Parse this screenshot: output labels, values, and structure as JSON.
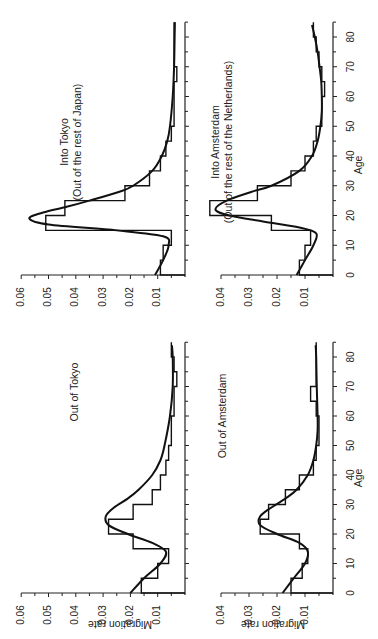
{
  "figure": {
    "orientation": "rotated 90 degrees counter-clockwise",
    "shared_xlabel": "Age",
    "shared_ylabel": "Migration rate"
  },
  "chart_data": [
    {
      "type": "line",
      "title": "Into Tokyo",
      "subtitle": "(Out of the rest of Japan)",
      "xlabel": "Age",
      "ylabel": "Migration rate",
      "xlim": [
        0,
        85
      ],
      "ylim": [
        0,
        0.06
      ],
      "x_ticks": [
        0,
        10,
        20,
        30,
        40,
        50,
        60,
        70,
        80
      ],
      "y_ticks": [
        0.01,
        0.02,
        0.03,
        0.04,
        0.05,
        0.06
      ],
      "series": [
        {
          "name": "observed (5-year age groups)",
          "style": "step",
          "x": [
            0,
            5,
            10,
            15,
            20,
            25,
            30,
            35,
            40,
            45,
            50,
            55,
            60,
            65,
            70,
            75,
            80
          ],
          "values": [
            0.009,
            0.008,
            0.005,
            0.051,
            0.044,
            0.022,
            0.013,
            0.009,
            0.007,
            0.005,
            0.004,
            0.004,
            0.004,
            0.003,
            0.004,
            0.004,
            0.004
          ]
        },
        {
          "name": "model schedule",
          "style": "smooth",
          "x": [
            0,
            5,
            10,
            13,
            15,
            17,
            19,
            21,
            23,
            25,
            28,
            30,
            35,
            40,
            45,
            50,
            60,
            70,
            80,
            85
          ],
          "values": [
            0.011,
            0.008,
            0.006,
            0.008,
            0.025,
            0.05,
            0.057,
            0.052,
            0.043,
            0.035,
            0.024,
            0.019,
            0.012,
            0.0085,
            0.0065,
            0.0055,
            0.0045,
            0.004,
            0.0038,
            0.0037
          ]
        }
      ]
    },
    {
      "type": "line",
      "title": "Into Amsterdam",
      "subtitle": "(Out of the rest of the Netherlands)",
      "xlabel": "Age",
      "ylabel": "Migration rate",
      "xlim": [
        0,
        85
      ],
      "ylim": [
        0,
        0.04
      ],
      "x_ticks": [
        0,
        10,
        20,
        30,
        40,
        50,
        60,
        70,
        80
      ],
      "y_ticks": [
        0.01,
        0.02,
        0.03,
        0.04
      ],
      "series": [
        {
          "name": "observed (5-year age groups)",
          "style": "step",
          "x": [
            0,
            5,
            10,
            15,
            20,
            25,
            30,
            35,
            40,
            45,
            50,
            55,
            60,
            65,
            70,
            75,
            80
          ],
          "values": [
            0.012,
            0.01,
            0.008,
            0.022,
            0.044,
            0.027,
            0.015,
            0.01,
            0.007,
            0.006,
            0.004,
            0.004,
            0.003,
            0.004,
            0.005,
            0.006,
            0.007
          ]
        },
        {
          "name": "model schedule",
          "style": "smooth",
          "x": [
            0,
            5,
            10,
            14,
            16,
            18,
            20,
            22,
            25,
            28,
            30,
            35,
            40,
            45,
            50,
            55,
            60,
            65,
            70,
            75,
            80,
            84
          ],
          "values": [
            0.013,
            0.01,
            0.007,
            0.006,
            0.012,
            0.025,
            0.037,
            0.042,
            0.038,
            0.029,
            0.022,
            0.012,
            0.0075,
            0.0055,
            0.0045,
            0.004,
            0.004,
            0.0042,
            0.0048,
            0.0055,
            0.0065,
            0.0075
          ]
        }
      ]
    },
    {
      "type": "line",
      "title": "Out of Tokyo",
      "subtitle": "",
      "xlabel": "Age",
      "ylabel": "Migration rate",
      "xlim": [
        0,
        85
      ],
      "ylim": [
        0,
        0.06
      ],
      "x_ticks": [
        0,
        10,
        20,
        30,
        40,
        50,
        60,
        70,
        80
      ],
      "y_ticks": [
        0.01,
        0.02,
        0.03,
        0.04,
        0.05,
        0.06
      ],
      "series": [
        {
          "name": "observed (5-year age groups)",
          "style": "step",
          "x": [
            0,
            5,
            10,
            15,
            20,
            25,
            30,
            35,
            40,
            45,
            50,
            55,
            60,
            65,
            70,
            75,
            80
          ],
          "values": [
            0.016,
            0.01,
            0.006,
            0.019,
            0.028,
            0.019,
            0.012,
            0.009,
            0.007,
            0.006,
            0.005,
            0.005,
            0.004,
            0.004,
            0.003,
            0.004,
            0.005
          ]
        },
        {
          "name": "model schedule",
          "style": "smooth",
          "x": [
            0,
            5,
            10,
            14,
            17,
            20,
            23,
            26,
            29,
            32,
            35,
            40,
            45,
            50,
            60,
            70,
            80,
            84
          ],
          "values": [
            0.02,
            0.015,
            0.009,
            0.007,
            0.012,
            0.021,
            0.028,
            0.029,
            0.026,
            0.021,
            0.017,
            0.012,
            0.009,
            0.0075,
            0.0055,
            0.0045,
            0.0045,
            0.0048
          ]
        }
      ]
    },
    {
      "type": "line",
      "title": "Out of Amsterdam",
      "subtitle": "",
      "xlabel": "Age",
      "ylabel": "Migration rate",
      "xlim": [
        0,
        85
      ],
      "ylim": [
        0,
        0.04
      ],
      "x_ticks": [
        0,
        10,
        20,
        30,
        40,
        50,
        60,
        70,
        80
      ],
      "y_ticks": [
        0.01,
        0.02,
        0.03,
        0.04
      ],
      "series": [
        {
          "name": "observed (5-year age groups)",
          "style": "step",
          "x": [
            0,
            5,
            10,
            15,
            20,
            25,
            30,
            35,
            40,
            45,
            50,
            55,
            60,
            65,
            70,
            75,
            80
          ],
          "values": [
            0.015,
            0.011,
            0.009,
            0.012,
            0.026,
            0.023,
            0.017,
            0.012,
            0.007,
            0.006,
            0.005,
            0.005,
            0.006,
            0.008,
            0.006,
            0.006,
            0.006
          ]
        },
        {
          "name": "model schedule",
          "style": "smooth",
          "x": [
            0,
            5,
            10,
            14,
            17,
            20,
            23,
            26,
            29,
            32,
            35,
            40,
            45,
            50,
            55,
            60,
            70,
            80,
            84
          ],
          "values": [
            0.018,
            0.014,
            0.01,
            0.009,
            0.012,
            0.02,
            0.026,
            0.026,
            0.022,
            0.017,
            0.013,
            0.009,
            0.007,
            0.006,
            0.0055,
            0.0055,
            0.0058,
            0.006,
            0.0062
          ]
        }
      ]
    }
  ]
}
